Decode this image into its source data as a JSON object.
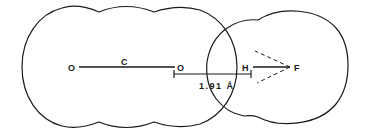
{
  "diagram": {
    "molecule_left": {
      "atoms": [
        {
          "label": "O",
          "x": 72,
          "y": 67
        },
        {
          "label": "C",
          "x": 124,
          "y": 62
        },
        {
          "label": "O",
          "x": 181,
          "y": 67
        }
      ]
    },
    "molecule_right": {
      "atoms": [
        {
          "label": "H",
          "x": 246,
          "y": 67
        },
        {
          "label": "F",
          "x": 297,
          "y": 67
        }
      ]
    },
    "distance_label": "1.91 Å",
    "colors": {
      "stroke": "#1a1a1a",
      "background": "#ffffff"
    }
  }
}
